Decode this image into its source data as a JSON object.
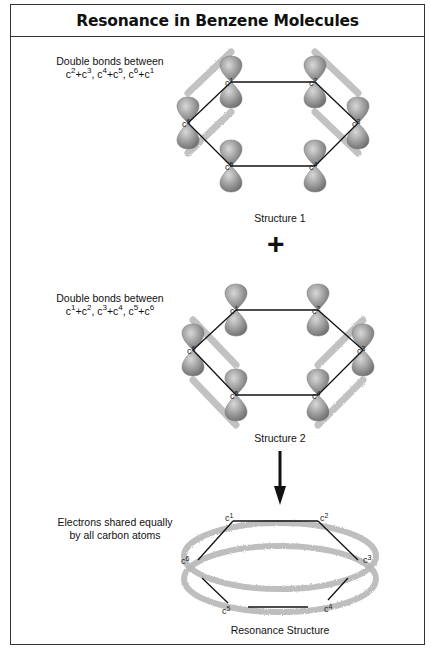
{
  "title": "Resonance in Benzene Molecules",
  "structure1": {
    "caption_line1": "Double bonds between",
    "caption_line2_html": "c<sup>2</sup>+c<sup>3</sup>, c<sup>4</sup>+c<sup>5</sup>, c<sup>6</sup>+c<sup>1</sup>",
    "label": "Structure 1",
    "atoms": [
      "c1",
      "c2",
      "c3",
      "c4",
      "c5",
      "c6"
    ],
    "double_bonds": [
      [
        "c2",
        "c3"
      ],
      [
        "c4",
        "c5"
      ],
      [
        "c6",
        "c1"
      ]
    ]
  },
  "operator": "+",
  "structure2": {
    "caption_line1": "Double bonds between",
    "caption_line2_html": "c<sup>1</sup>+c<sup>2</sup>, c<sup>3</sup>+c<sup>4</sup>, c<sup>5</sup>+c<sup>6</sup>",
    "label": "Structure 2",
    "atoms": [
      "c1",
      "c2",
      "c3",
      "c4",
      "c5",
      "c6"
    ],
    "double_bonds": [
      [
        "c1",
        "c2"
      ],
      [
        "c3",
        "c4"
      ],
      [
        "c5",
        "c6"
      ]
    ]
  },
  "resonance": {
    "caption_line1": "Electrons shared equally",
    "caption_line2": "by all carbon atoms",
    "label": "Resonance Structure",
    "atoms": [
      "c1",
      "c2",
      "c3",
      "c4",
      "c5",
      "c6"
    ]
  },
  "colors": {
    "border": "#333333",
    "lobe": "#9a9a9a",
    "pi_cloud": "#b8b8b8",
    "bond": "#111111"
  }
}
